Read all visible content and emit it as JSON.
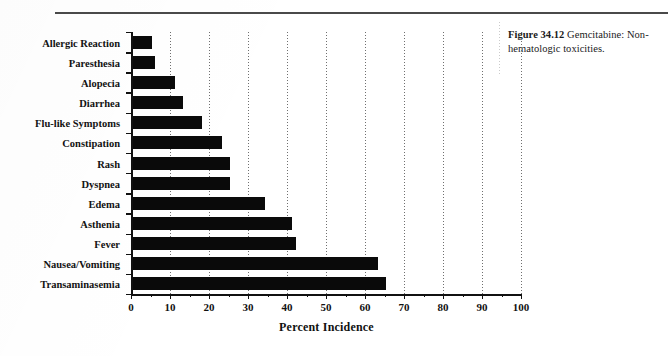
{
  "page": {
    "top_rule": "horizontal-rule"
  },
  "caption": {
    "figure_number": "Figure 34.12",
    "text": " Gemcitabine: Non-hematologic toxicities."
  },
  "chart_data": {
    "type": "bar",
    "orientation": "horizontal",
    "title": "",
    "xlabel": "Percent Incidence",
    "ylabel": "",
    "xlim": [
      0,
      100
    ],
    "xticks": [
      0,
      10,
      20,
      30,
      40,
      50,
      60,
      70,
      80,
      90,
      100
    ],
    "minor_tick_step": 5,
    "grid": "vertical dotted gridlines at major ticks",
    "legend": "none",
    "bar_color": "#0a0a0a",
    "categories": [
      "Allergic Reaction",
      "Paresthesia",
      "Alopecia",
      "Diarrhea",
      "Flu-like Symptoms",
      "Constipation",
      "Rash",
      "Dyspnea",
      "Edema",
      "Asthenia",
      "Fever",
      "Nausea/Vomiting",
      "Transaminasemia"
    ],
    "values": [
      5,
      6,
      11,
      13,
      18,
      23,
      25,
      25,
      34,
      41,
      42,
      63,
      65
    ]
  }
}
